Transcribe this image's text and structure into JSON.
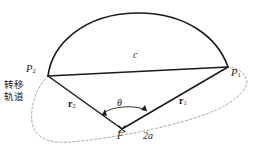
{
  "diagram": {
    "annotation_cjk": {
      "line1": "转移",
      "line2": "轨道",
      "meaning": "transfer orbit"
    },
    "labels": {
      "p2": "P",
      "p2_sub": "2",
      "p1": "P",
      "p1_sub": "1",
      "chord": "c",
      "r2": "r",
      "r2_sub": "2",
      "r1": "r",
      "r1_sub": "1",
      "theta": "θ",
      "focus": "F",
      "major_axis": "2a"
    },
    "colors": {
      "stroke": "#1a1a1a",
      "dashed": "#8a8a8a",
      "background": "#ffffff"
    },
    "geometry": {
      "point_p2": [
        48,
        76
      ],
      "point_p1": [
        228,
        67
      ],
      "point_f": [
        122,
        129
      ],
      "arc_apex": [
        140,
        13
      ],
      "chord_label_pos": [
        137,
        55
      ],
      "theta_arc_radius": 26
    }
  }
}
